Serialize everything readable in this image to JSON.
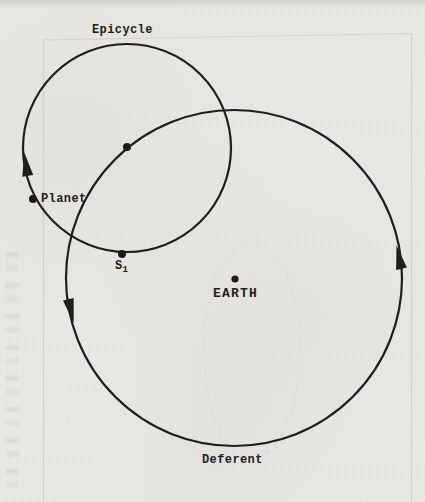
{
  "figure": {
    "labels": {
      "epicycle": "Epicycle",
      "planet": "Planet",
      "s1_base": "S",
      "s1_sub": "1",
      "earth": "EARTH",
      "deferent": "Deferent"
    },
    "colors": {
      "ink": "#1f1f1f",
      "paper": "#e9e8e4",
      "ghost_line": "#d2d1c8"
    }
  }
}
